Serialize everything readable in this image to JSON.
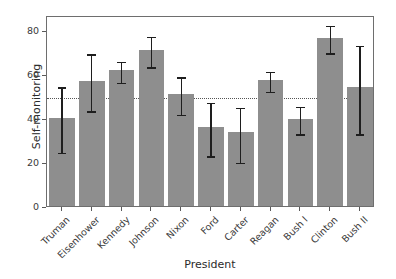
{
  "chart_data": {
    "type": "bar",
    "title": "",
    "xlabel": "President",
    "ylabel": "Self-monitoring",
    "categories": [
      "Truman",
      "Eisenhower",
      "Kennedy",
      "Johnson",
      "Nixon",
      "Ford",
      "Carter",
      "Reagan",
      "Bush I",
      "Clinton",
      "Bush II"
    ],
    "values": [
      40.0,
      57.0,
      61.8,
      71.0,
      51.0,
      36.0,
      33.5,
      57.5,
      39.8,
      76.5,
      54.0
    ],
    "error_low": [
      25.0,
      44.0,
      57.0,
      64.0,
      42.5,
      23.5,
      20.5,
      53.0,
      33.5,
      70.5,
      33.5
    ],
    "error_high": [
      55.0,
      70.0,
      66.5,
      78.0,
      59.5,
      48.0,
      45.5,
      62.0,
      46.0,
      83.0,
      74.0
    ],
    "ylim": [
      0,
      87
    ],
    "yticks": [
      0,
      20,
      40,
      60,
      80
    ],
    "ytick_labels": [
      "0",
      "20",
      "40",
      "60",
      "80"
    ],
    "grid": false,
    "legend": null,
    "reference_line": {
      "value": 50,
      "style": "dotted",
      "orientation": "horizontal"
    },
    "bar_color": "#8e8e8e",
    "error_color": "#1e1e1e",
    "axis_color": "#6e6e6e",
    "text_color": "#2b2b2b"
  }
}
